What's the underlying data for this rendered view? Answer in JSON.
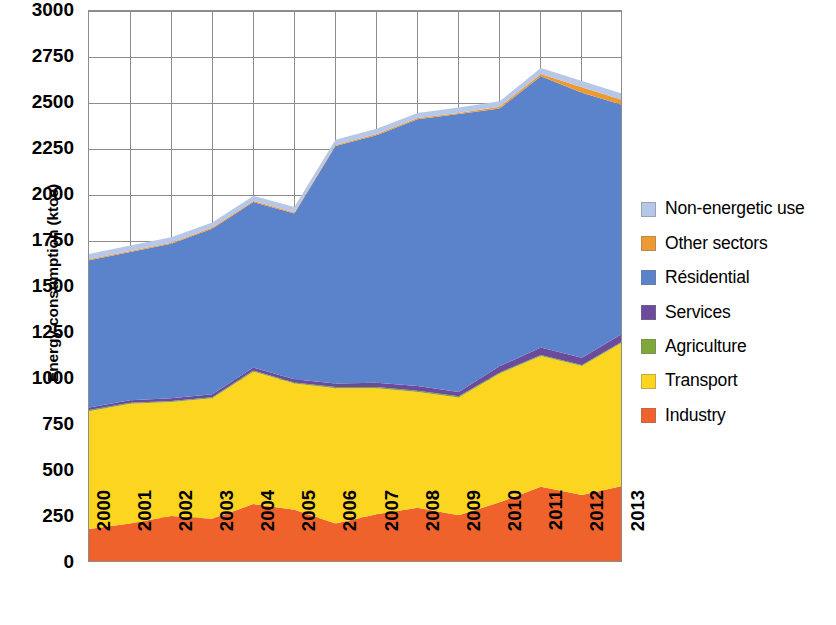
{
  "chart_data": {
    "type": "area",
    "stacked": true,
    "title": "",
    "xlabel": "",
    "ylabel": "Energy consumption (ktoe)",
    "categories": [
      "2000",
      "2001",
      "2002",
      "2003",
      "2004",
      "2005",
      "2006",
      "2007",
      "2008",
      "2009",
      "2010",
      "2011",
      "2012",
      "2013"
    ],
    "x": [
      2000,
      2001,
      2002,
      2003,
      2004,
      2005,
      2006,
      2007,
      2008,
      2009,
      2010,
      2011,
      2012,
      2013
    ],
    "ylim": [
      0,
      3000
    ],
    "yticks": [
      0,
      250,
      500,
      750,
      1000,
      1250,
      1500,
      1750,
      2000,
      2250,
      2500,
      2750,
      3000
    ],
    "ytick_labels": [
      "0",
      "250",
      "500",
      "750",
      "1000",
      "1250",
      "1500",
      "1750",
      "2000",
      "2250",
      "2500",
      "2750",
      "3000"
    ],
    "grid": true,
    "grid_axis": "both",
    "legend_position": "right",
    "legend_order_top_to_bottom": [
      "Non-energetic use",
      "Other sectors",
      "Résidential",
      "Services",
      "Agriculture",
      "Transport",
      "Industry"
    ],
    "stack_order_bottom_to_top": [
      "Industry",
      "Transport",
      "Agriculture",
      "Services",
      "Résidential",
      "Other sectors",
      "Non-energetic use"
    ],
    "series": [
      {
        "name": "Industry",
        "color": "#F0622B",
        "values": [
          185,
          215,
          255,
          240,
          320,
          290,
          215,
          265,
          300,
          260,
          330,
          415,
          370,
          420
        ]
      },
      {
        "name": "Transport",
        "color": "#FCD521",
        "values": [
          640,
          650,
          620,
          655,
          720,
          685,
          735,
          685,
          630,
          640,
          700,
          710,
          700,
          780
        ]
      },
      {
        "name": "Agriculture",
        "color": "#7FA83B",
        "values": [
          6,
          6,
          6,
          6,
          6,
          6,
          6,
          6,
          6,
          6,
          6,
          6,
          6,
          6
        ]
      },
      {
        "name": "Services",
        "color": "#6C4B9B",
        "values": [
          14,
          14,
          14,
          16,
          16,
          18,
          20,
          24,
          26,
          24,
          34,
          40,
          40,
          42
        ]
      },
      {
        "name": "Résidential",
        "color": "#5B83CC",
        "values": [
          800,
          805,
          840,
          900,
          900,
          900,
          1290,
          1345,
          1450,
          1510,
          1400,
          1475,
          1440,
          1240
        ]
      },
      {
        "name": "Other sectors",
        "color": "#EE9A32",
        "values": [
          6,
          6,
          6,
          6,
          6,
          6,
          6,
          6,
          6,
          6,
          10,
          12,
          30,
          28
        ]
      },
      {
        "name": "Non-energetic use",
        "color": "#B6C7E8",
        "values": [
          29,
          29,
          29,
          28,
          27,
          30,
          28,
          29,
          28,
          29,
          30,
          32,
          34,
          34
        ]
      }
    ],
    "totals": [
      1680,
      1725,
      1770,
      1851,
      1995,
      1935,
      2300,
      2360,
      2446,
      2475,
      2510,
      2690,
      2620,
      2550
    ]
  },
  "axis": {
    "y_title": "Energy consumption (ktoe)",
    "y_tick_labels": [
      "3000",
      "2750",
      "2500",
      "2250",
      "2000",
      "1750",
      "1500",
      "1250",
      "1000",
      "750",
      "500",
      "250",
      "0"
    ],
    "x_tick_labels": [
      "2000",
      "2001",
      "2002",
      "2003",
      "2004",
      "2005",
      "2006",
      "2007",
      "2008",
      "2009",
      "2010",
      "2011",
      "2012",
      "2013"
    ]
  },
  "legend": {
    "items": [
      {
        "label": "Non-energetic use",
        "color": "#B6C7E8"
      },
      {
        "label": "Other sectors",
        "color": "#EE9A32"
      },
      {
        "label": "Résidential",
        "color": "#5B83CC"
      },
      {
        "label": "Services",
        "color": "#6C4B9B"
      },
      {
        "label": "Agriculture",
        "color": "#7FA83B"
      },
      {
        "label": "Transport",
        "color": "#FCD521"
      },
      {
        "label": "Industry",
        "color": "#F0622B"
      }
    ]
  },
  "style": {
    "grid_color": "#8d8d8d",
    "plot_border_color": "#8d8d8d",
    "background": "#ffffff"
  }
}
